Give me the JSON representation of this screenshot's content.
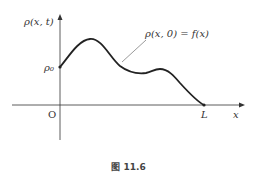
{
  "figure": {
    "y_axis_label": "ρ(x, t)",
    "x_axis_label": "x",
    "origin_label": "O",
    "y_intercept_label": "ρ₀",
    "x_end_label": "L",
    "curve_annotation": "ρ(x, 0) = f(x)",
    "caption": "图 11.6"
  },
  "colors": {
    "axis": "#333333",
    "curve": "#222222",
    "leader": "#555555",
    "background": "#ffffff"
  }
}
